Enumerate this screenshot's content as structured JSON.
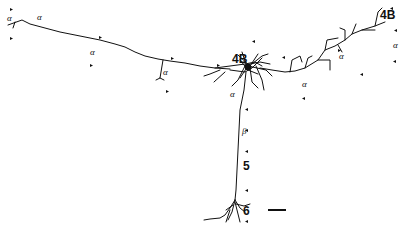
{
  "figure": {
    "labels": {
      "layer_4b_center": "4B",
      "layer_4b_right": "4B",
      "layer_5": "5",
      "layer_6": "6",
      "alpha": "α",
      "beta": "β"
    },
    "alpha_labels": [
      "α",
      "α",
      "α",
      "α",
      "α",
      "α",
      "α",
      "α"
    ],
    "scale_bar": {
      "label": ""
    },
    "colors": {
      "ink": "#111111",
      "background": "#ffffff"
    }
  }
}
